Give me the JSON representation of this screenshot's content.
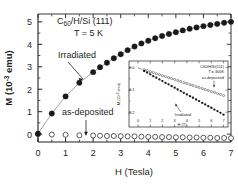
{
  "figure": {
    "main": {
      "title_line1_pre": "C",
      "title_line1_sub": "60",
      "title_line1_post": "/H/Si (111)",
      "title_line2": "T = 5 K",
      "ylabel_pre": "M (10",
      "ylabel_sup": "-3",
      "ylabel_post": " emu)",
      "xlabel": "H (Tesla)",
      "xticks": [
        "0",
        "1",
        "2",
        "3",
        "4",
        "5",
        "6",
        "7"
      ],
      "yticks": [
        "0",
        "1",
        "2",
        "3",
        "4",
        "5"
      ],
      "annotation_irradiated": "Irradiated",
      "annotation_asdeposited": "as-deposited"
    },
    "inset": {
      "title_line1": "C60/H/Si(111)",
      "title_line2": "T = 300K",
      "label_asdeposited": "as-deposited",
      "label_irradiated": "Irradiated",
      "ylabel_pre": "M (10",
      "ylabel_sup": "-3",
      "ylabel_post": " emu)",
      "xlabel": "H (T)",
      "xticks": [
        "0",
        "1",
        "2",
        "3",
        "4",
        "5",
        "6",
        "7"
      ],
      "yticks": [
        "0.0",
        "-0.1",
        "-0.2"
      ]
    },
    "colors": {
      "ink": "#231f20",
      "filled_marker": "#1a1a1a",
      "open_marker_edge": "#3c3c3c",
      "background": "#ffffff",
      "guide_line": "#8c8c8c"
    }
  },
  "chart_data": {
    "type": "scatter",
    "title": "C60/H/Si (111)  T = 5 K",
    "xlabel": "H (Tesla)",
    "ylabel": "M (10^-3 emu)",
    "xlim": [
      0,
      7
    ],
    "ylim": [
      -0.35,
      5.35
    ],
    "grid": false,
    "legend_position": "inline-annotations",
    "series": [
      {
        "name": "Irradiated",
        "marker": "filled-circle",
        "x": [
          0.0,
          0.5,
          1.0,
          1.5,
          2.0,
          2.25,
          2.5,
          2.75,
          3.0,
          3.25,
          3.5,
          3.75,
          4.0,
          4.25,
          4.5,
          4.75,
          5.0,
          5.25,
          5.5,
          5.75,
          6.0,
          6.25,
          6.5,
          6.75,
          7.0
        ],
        "y": [
          0.02,
          0.92,
          1.68,
          2.29,
          2.76,
          2.98,
          3.18,
          3.38,
          3.56,
          3.74,
          3.9,
          4.04,
          4.16,
          4.27,
          4.37,
          4.46,
          4.54,
          4.62,
          4.69,
          4.75,
          4.81,
          4.86,
          4.91,
          4.96,
          5.0
        ]
      },
      {
        "name": "as-deposited",
        "marker": "open-circle",
        "x": [
          0.0,
          0.5,
          1.0,
          1.5,
          2.0,
          2.25,
          2.5,
          2.75,
          3.0,
          3.25,
          3.5,
          3.75,
          4.0,
          4.25,
          4.5,
          4.75,
          5.0,
          5.25,
          5.5,
          5.75,
          6.0,
          6.25,
          6.5,
          6.75,
          7.0
        ],
        "y": [
          0.0,
          -0.02,
          -0.03,
          -0.05,
          -0.06,
          -0.07,
          -0.08,
          -0.08,
          -0.09,
          -0.1,
          -0.1,
          -0.11,
          -0.12,
          -0.12,
          -0.13,
          -0.13,
          -0.14,
          -0.14,
          -0.15,
          -0.15,
          -0.16,
          -0.16,
          -0.17,
          -0.17,
          -0.18
        ]
      }
    ],
    "inset_chart": {
      "type": "scatter",
      "title": "C60/H/Si(111)  T = 300K",
      "xlabel": "H (T)",
      "ylabel": "M (10^-3 emu)",
      "xlim": [
        0,
        7.2
      ],
      "ylim": [
        -0.235,
        0.012
      ],
      "grid": false,
      "series": [
        {
          "name": "as-deposited",
          "marker": "open-circle",
          "x": [
            0.5,
            0.75,
            1.0,
            1.25,
            1.5,
            1.75,
            2.0,
            2.25,
            2.5,
            2.75,
            3.0,
            3.25,
            3.5,
            3.75,
            4.0,
            4.25,
            4.5,
            4.75,
            5.0,
            5.25,
            5.5,
            5.75,
            6.0,
            6.25,
            6.5,
            6.75,
            7.0
          ],
          "y": [
            -0.009,
            -0.013,
            -0.018,
            -0.022,
            -0.027,
            -0.031,
            -0.036,
            -0.04,
            -0.045,
            -0.049,
            -0.053,
            -0.058,
            -0.062,
            -0.067,
            -0.071,
            -0.076,
            -0.08,
            -0.085,
            -0.089,
            -0.094,
            -0.098,
            -0.102,
            -0.107,
            -0.111,
            -0.116,
            -0.12,
            -0.125
          ]
        },
        {
          "name": "Irradiated",
          "marker": "filled-circle",
          "x": [
            0.5,
            0.75,
            1.0,
            1.25,
            1.5,
            1.75,
            2.0,
            2.25,
            2.5,
            2.75,
            3.0,
            3.25,
            3.5,
            3.75,
            4.0,
            4.25,
            4.5,
            4.75,
            5.0,
            5.25,
            5.5,
            5.75,
            6.0,
            6.25,
            6.5,
            6.75,
            7.0
          ],
          "y": [
            -0.015,
            -0.022,
            -0.03,
            -0.038,
            -0.045,
            -0.053,
            -0.06,
            -0.068,
            -0.075,
            -0.083,
            -0.09,
            -0.098,
            -0.105,
            -0.113,
            -0.12,
            -0.128,
            -0.135,
            -0.143,
            -0.15,
            -0.158,
            -0.165,
            -0.173,
            -0.18,
            -0.188,
            -0.195,
            -0.203,
            -0.211
          ]
        }
      ]
    }
  }
}
